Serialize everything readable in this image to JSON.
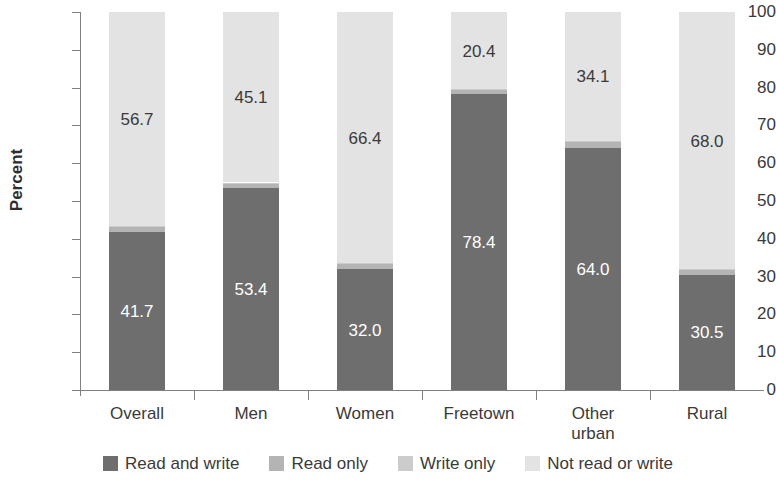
{
  "chart_data": {
    "type": "bar",
    "subtype": "stacked-bar-100",
    "title": "",
    "xlabel": "",
    "ylabel": "Percent",
    "ylim": [
      0,
      100
    ],
    "yticks": [
      0,
      10,
      20,
      30,
      40,
      50,
      60,
      70,
      80,
      90,
      100
    ],
    "ytick_labels": [
      "0",
      "10",
      "20",
      "30",
      "40",
      "50",
      "60",
      "70",
      "80",
      "90",
      "100"
    ],
    "grid": false,
    "legend_position": "bottom",
    "categories": [
      "Overall",
      "Men",
      "Women",
      "Freetown",
      "Other urban",
      "Rural"
    ],
    "category_label_lines": [
      [
        "Overall"
      ],
      [
        "Men"
      ],
      [
        "Women"
      ],
      [
        "Freetown"
      ],
      [
        "Other",
        "urban"
      ],
      [
        "Rural"
      ]
    ],
    "series": [
      {
        "name": "Read and write",
        "color": "#6e6e6e",
        "label_color": "on-dark",
        "show_labels": true,
        "values": [
          41.7,
          53.4,
          32.0,
          78.4,
          64.0,
          30.5
        ],
        "value_labels": [
          "41.7",
          "53.4",
          "32.0",
          "78.4",
          "64.0",
          "30.5"
        ]
      },
      {
        "name": "Read only",
        "color": "#b4b4b4",
        "label_color": "on-light",
        "show_labels": false,
        "values": [
          1.3,
          1.2,
          1.4,
          1.0,
          1.6,
          1.3
        ],
        "value_labels": [
          "",
          "",
          "",
          "",
          "",
          ""
        ]
      },
      {
        "name": "Write only",
        "color": "#cccccc",
        "label_color": "on-light",
        "show_labels": false,
        "values": [
          0.3,
          0.3,
          0.2,
          0.2,
          0.3,
          0.2
        ],
        "value_labels": [
          "",
          "",
          "",
          "",
          "",
          ""
        ]
      },
      {
        "name": "Not read or write",
        "color": "#e3e3e3",
        "label_color": "on-light",
        "show_labels": true,
        "values": [
          56.7,
          45.1,
          66.4,
          20.4,
          34.1,
          68.0
        ],
        "value_labels": [
          "56.7",
          "45.1",
          "66.4",
          "20.4",
          "34.1",
          "68.0"
        ]
      }
    ],
    "legend": [
      {
        "label": "Read and write",
        "color": "#6e6e6e"
      },
      {
        "label": "Read only",
        "color": "#b4b4b4"
      },
      {
        "label": "Write only",
        "color": "#cccccc"
      },
      {
        "label": "Not read or write",
        "color": "#e3e3e3"
      }
    ]
  }
}
